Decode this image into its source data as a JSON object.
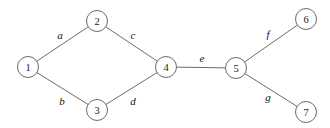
{
  "figure": {
    "background_color": "#ffffff",
    "line_color": "#5a5a5a",
    "text_color": "#111111"
  },
  "graph": {
    "node_radius": 10.5,
    "nodes": [
      {
        "id": "1",
        "label": "1",
        "x": 28,
        "y": 67
      },
      {
        "id": "2",
        "label": "2",
        "x": 97,
        "y": 21
      },
      {
        "id": "3",
        "label": "3",
        "x": 97,
        "y": 110
      },
      {
        "id": "4",
        "label": "4",
        "x": 166,
        "y": 67
      },
      {
        "id": "5",
        "label": "5",
        "x": 236,
        "y": 68
      },
      {
        "id": "6",
        "label": "6",
        "x": 306,
        "y": 19
      },
      {
        "id": "7",
        "label": "7",
        "x": 306,
        "y": 112
      }
    ],
    "edges": [
      {
        "id": "a",
        "label": "a",
        "from": "1",
        "to": "2",
        "label_x": 60,
        "label_y": 35
      },
      {
        "id": "b",
        "label": "b",
        "from": "1",
        "to": "3",
        "label_x": 62,
        "label_y": 101
      },
      {
        "id": "c",
        "label": "c",
        "from": "2",
        "to": "4",
        "label_x": 133,
        "label_y": 35
      },
      {
        "id": "d",
        "label": "d",
        "from": "3",
        "to": "4",
        "label_x": 133,
        "label_y": 101
      },
      {
        "id": "e",
        "label": "e",
        "from": "4",
        "to": "5",
        "label_x": 202,
        "label_y": 58
      },
      {
        "id": "f",
        "label": "f",
        "from": "5",
        "to": "6",
        "label_x": 268,
        "label_y": 34
      },
      {
        "id": "g",
        "label": "g",
        "from": "5",
        "to": "7",
        "label_x": 268,
        "label_y": 97
      }
    ]
  }
}
